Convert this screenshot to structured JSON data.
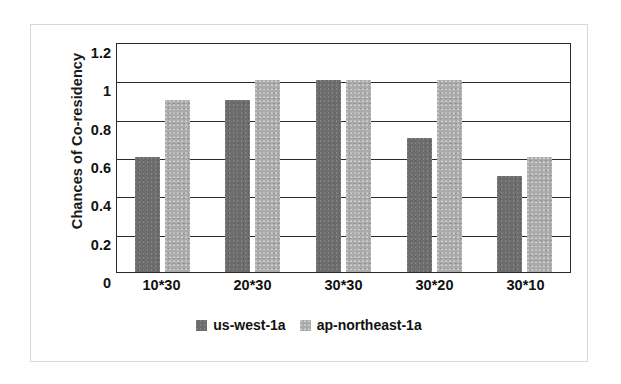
{
  "chart_data": {
    "type": "bar",
    "title": "",
    "subtitle": "",
    "xlabel": "",
    "ylabel": "Chances of Co-residency",
    "categories": [
      "10*30",
      "20*30",
      "30*30",
      "30*20",
      "30*10"
    ],
    "series": [
      {
        "name": "us-west-1a",
        "color": "#6d6d6d",
        "values": [
          0.6,
          0.9,
          1.0,
          0.7,
          0.5
        ]
      },
      {
        "name": "ap-northeast-1a",
        "color": "#ababab",
        "values": [
          0.9,
          1.0,
          1.0,
          1.0,
          0.6
        ]
      }
    ],
    "ylim": [
      0,
      1.2
    ],
    "ytick_values": [
      0,
      0.2,
      0.4,
      0.6,
      0.8,
      1.0,
      1.2
    ],
    "ytick_labels": [
      "0",
      "0.2",
      "0.4",
      "0.6",
      "0.8",
      "1",
      "1.2"
    ],
    "grid": "horizontal",
    "legend_position": "bottom-center",
    "annotations": []
  },
  "axes": {
    "y_title": "Chances of Co-residency"
  },
  "legend": {
    "entries": [
      {
        "label": "us-west-1a",
        "swatch": "series-a-swatch"
      },
      {
        "label": "ap-northeast-1a",
        "swatch": "series-b-swatch"
      }
    ]
  }
}
